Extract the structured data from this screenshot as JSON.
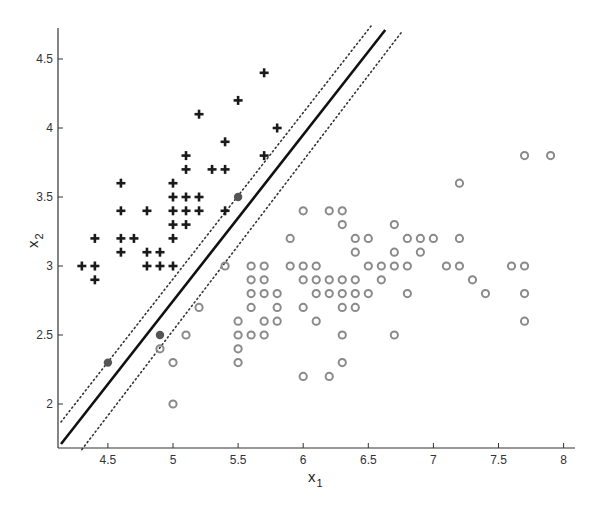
{
  "chart_data": {
    "type": "scatter",
    "title": "",
    "xlabel": "x",
    "xlabel_sub": "1",
    "ylabel": "x",
    "ylabel_sub": "2",
    "xlim": [
      4.14,
      8.08
    ],
    "ylim": [
      1.67,
      4.72
    ],
    "x_ticks": [
      4.5,
      5,
      5.5,
      6,
      6.5,
      7,
      7.5,
      8
    ],
    "x_tick_labels": [
      "4.5",
      "5",
      "5.5",
      "6",
      "6.5",
      "7",
      "7.5",
      "8"
    ],
    "y_ticks": [
      2,
      2.5,
      3,
      3.5,
      4,
      4.5
    ],
    "y_tick_labels": [
      "2",
      "2.5",
      "3",
      "3.5",
      "4",
      "4.5"
    ],
    "grid": false,
    "legend": null,
    "colors": {
      "plus": "#1a1a1a",
      "circle": "#8a8a8a",
      "support_vector": "#555555",
      "boundary": "#111111",
      "margin": "#333333",
      "axis": "#333333"
    },
    "series": [
      {
        "name": "class +1 (plus)",
        "marker": "plus",
        "points": [
          [
            5.7,
            4.4
          ],
          [
            5.5,
            4.2
          ],
          [
            5.2,
            4.1
          ],
          [
            5.8,
            4.0
          ],
          [
            5.4,
            3.9
          ],
          [
            5.1,
            3.8
          ],
          [
            5.7,
            3.8
          ],
          [
            5.1,
            3.7
          ],
          [
            5.3,
            3.7
          ],
          [
            5.4,
            3.7
          ],
          [
            4.6,
            3.6
          ],
          [
            5.0,
            3.6
          ],
          [
            5.0,
            3.5
          ],
          [
            5.1,
            3.5
          ],
          [
            5.2,
            3.5
          ],
          [
            4.6,
            3.4
          ],
          [
            4.8,
            3.4
          ],
          [
            5.0,
            3.4
          ],
          [
            5.1,
            3.4
          ],
          [
            5.2,
            3.4
          ],
          [
            5.4,
            3.4
          ],
          [
            5.0,
            3.3
          ],
          [
            5.1,
            3.3
          ],
          [
            4.4,
            3.2
          ],
          [
            4.6,
            3.2
          ],
          [
            4.7,
            3.2
          ],
          [
            5.0,
            3.2
          ],
          [
            4.6,
            3.1
          ],
          [
            4.8,
            3.1
          ],
          [
            4.9,
            3.1
          ],
          [
            4.3,
            3.0
          ],
          [
            4.4,
            3.0
          ],
          [
            4.8,
            3.0
          ],
          [
            4.9,
            3.0
          ],
          [
            5.0,
            3.0
          ],
          [
            4.4,
            2.9
          ]
        ]
      },
      {
        "name": "class -1 (circle)",
        "marker": "circle",
        "points": [
          [
            7.7,
            3.8
          ],
          [
            7.9,
            3.8
          ],
          [
            7.2,
            3.6
          ],
          [
            6.0,
            3.4
          ],
          [
            6.2,
            3.4
          ],
          [
            6.3,
            3.4
          ],
          [
            6.3,
            3.3
          ],
          [
            6.7,
            3.3
          ],
          [
            5.9,
            3.2
          ],
          [
            6.4,
            3.2
          ],
          [
            6.5,
            3.2
          ],
          [
            6.8,
            3.2
          ],
          [
            6.9,
            3.2
          ],
          [
            7.0,
            3.2
          ],
          [
            7.2,
            3.2
          ],
          [
            6.4,
            3.1
          ],
          [
            6.7,
            3.1
          ],
          [
            6.9,
            3.1
          ],
          [
            5.4,
            3.0
          ],
          [
            5.6,
            3.0
          ],
          [
            5.7,
            3.0
          ],
          [
            5.9,
            3.0
          ],
          [
            6.0,
            3.0
          ],
          [
            6.1,
            3.0
          ],
          [
            6.5,
            3.0
          ],
          [
            6.6,
            3.0
          ],
          [
            6.7,
            3.0
          ],
          [
            6.8,
            3.0
          ],
          [
            7.1,
            3.0
          ],
          [
            7.2,
            3.0
          ],
          [
            7.6,
            3.0
          ],
          [
            7.7,
            3.0
          ],
          [
            5.6,
            2.9
          ],
          [
            5.7,
            2.9
          ],
          [
            6.0,
            2.9
          ],
          [
            6.1,
            2.9
          ],
          [
            6.2,
            2.9
          ],
          [
            6.3,
            2.9
          ],
          [
            6.4,
            2.9
          ],
          [
            6.6,
            2.9
          ],
          [
            7.3,
            2.9
          ],
          [
            5.6,
            2.8
          ],
          [
            5.7,
            2.8
          ],
          [
            5.8,
            2.8
          ],
          [
            6.1,
            2.8
          ],
          [
            6.2,
            2.8
          ],
          [
            6.3,
            2.8
          ],
          [
            6.4,
            2.8
          ],
          [
            6.5,
            2.8
          ],
          [
            6.8,
            2.8
          ],
          [
            7.4,
            2.8
          ],
          [
            7.7,
            2.8
          ],
          [
            5.2,
            2.7
          ],
          [
            5.6,
            2.7
          ],
          [
            5.8,
            2.7
          ],
          [
            6.0,
            2.7
          ],
          [
            6.3,
            2.7
          ],
          [
            6.4,
            2.7
          ],
          [
            5.5,
            2.6
          ],
          [
            5.7,
            2.6
          ],
          [
            5.8,
            2.6
          ],
          [
            6.1,
            2.6
          ],
          [
            7.7,
            2.6
          ],
          [
            5.1,
            2.5
          ],
          [
            5.5,
            2.5
          ],
          [
            5.6,
            2.5
          ],
          [
            5.7,
            2.5
          ],
          [
            6.3,
            2.5
          ],
          [
            6.7,
            2.5
          ],
          [
            4.9,
            2.4
          ],
          [
            5.5,
            2.4
          ],
          [
            5.0,
            2.3
          ],
          [
            5.5,
            2.3
          ],
          [
            6.3,
            2.3
          ],
          [
            6.0,
            2.2
          ],
          [
            6.2,
            2.2
          ],
          [
            5.0,
            2.0
          ]
        ]
      },
      {
        "name": "support vectors",
        "marker": "filled-circle",
        "points": [
          [
            5.5,
            3.5
          ],
          [
            4.9,
            2.5
          ],
          [
            4.5,
            2.3
          ]
        ]
      }
    ],
    "lines": [
      {
        "name": "decision boundary",
        "style": "solid",
        "from": [
          4.14,
          1.71
        ],
        "to": [
          6.63,
          4.71
        ]
      },
      {
        "name": "margin upper",
        "style": "dotted",
        "from": [
          4.14,
          1.87
        ],
        "to": [
          6.53,
          4.75
        ]
      },
      {
        "name": "margin lower",
        "style": "dotted",
        "from": [
          4.3,
          1.67
        ],
        "to": [
          6.76,
          4.7
        ]
      }
    ]
  }
}
